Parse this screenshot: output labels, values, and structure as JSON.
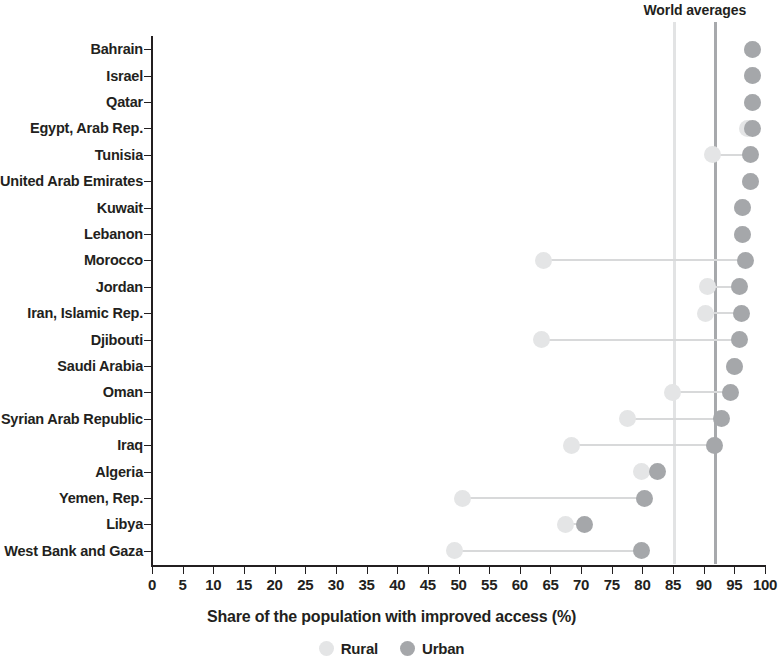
{
  "chart_data": {
    "type": "scatter",
    "subtype": "dumbbell",
    "title": "",
    "xlabel": "Share of the population with improved access (%)",
    "ylabel": "",
    "xlim": [
      0,
      100
    ],
    "xticks": [
      0,
      5,
      10,
      15,
      20,
      25,
      30,
      35,
      40,
      45,
      50,
      55,
      60,
      65,
      70,
      75,
      80,
      85,
      90,
      95,
      100
    ],
    "xtick_labels": [
      "0",
      "5",
      "10",
      "15",
      "20",
      "25",
      "30",
      "35",
      "40",
      "45",
      "50",
      "55",
      "60",
      "65",
      "70",
      "75",
      "80",
      "85",
      "90",
      "95",
      "100"
    ],
    "grid": false,
    "legend_position": "bottom",
    "legend": [
      {
        "name": "Rural",
        "color": "#e4e5e6"
      },
      {
        "name": "Urban",
        "color": "#a5a7aa"
      }
    ],
    "annotations": [
      {
        "text": "World averages",
        "position": "top"
      }
    ],
    "reference_lines": [
      {
        "name": "Rural world average",
        "value": 85.2,
        "color": "#e2e3e4"
      },
      {
        "name": "Urban world average",
        "value": 91.9,
        "color": "#a7a9ac"
      }
    ],
    "categories": [
      "Bahrain",
      "Israel",
      "Qatar",
      "Egypt, Arab Rep.",
      "Tunisia",
      "United Arab Emirates",
      "Kuwait",
      "Lebanon",
      "Morocco",
      "Jordan",
      "Iran, Islamic Rep.",
      "Djibouti",
      "Saudi Arabia",
      "Oman",
      "Syrian Arab Republic",
      "Iraq",
      "Algeria",
      "Yemen, Rep.",
      "Libya",
      "West Bank and Gaza"
    ],
    "series": [
      {
        "name": "Rural",
        "color": "#e4e5e6",
        "values": [
          98.0,
          98.0,
          98.0,
          97.2,
          91.4,
          97.6,
          96.3,
          96.3,
          63.8,
          90.7,
          90.3,
          63.5,
          95.1,
          84.9,
          77.5,
          68.5,
          79.9,
          50.7,
          67.5,
          49.4
        ]
      },
      {
        "name": "Urban",
        "color": "#a5a7aa",
        "values": [
          98.0,
          98.0,
          98.0,
          98.0,
          97.6,
          97.6,
          96.3,
          96.3,
          96.9,
          95.9,
          96.2,
          95.8,
          95.1,
          94.3,
          92.9,
          91.8,
          82.4,
          80.4,
          70.6,
          79.8
        ]
      }
    ]
  },
  "axis": {
    "world_averages_caption": "World averages"
  }
}
